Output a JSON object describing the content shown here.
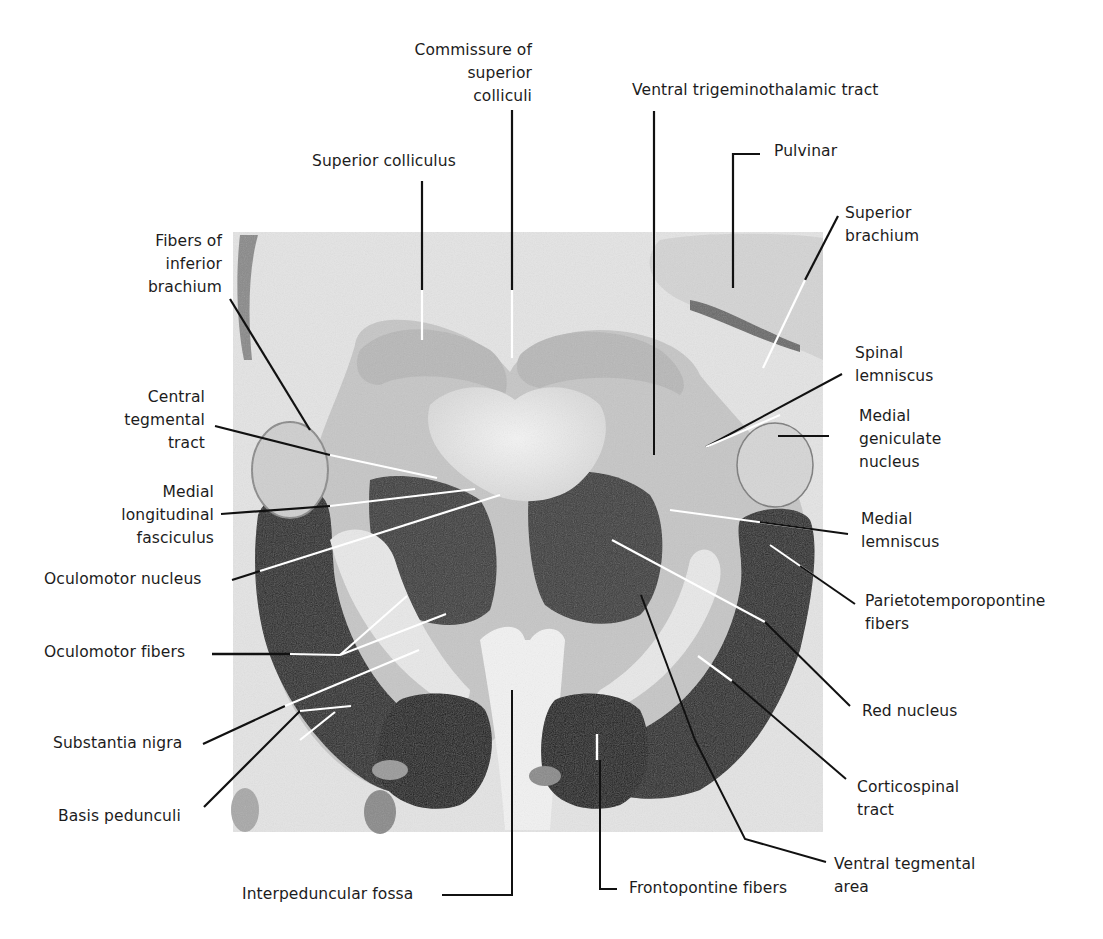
{
  "figure": {
    "colors": {
      "background": "#ffffff",
      "section_bg": "#e6e6e6",
      "dark_tissue": "#2a2a2a",
      "mid_tissue": "#9a9a9a",
      "light_tissue": "#d2d2d2",
      "text": "#1c1c1c",
      "leader_black": "#111111",
      "leader_white": "#ffffff"
    }
  },
  "labels": {
    "commissure": [
      "Commissure of",
      "superior",
      "colliculi"
    ],
    "superior_colliculus": [
      "Superior colliculus"
    ],
    "ventral_trigeminothalamic": [
      "Ventral trigeminothalamic tract"
    ],
    "pulvinar": [
      "Pulvinar"
    ],
    "superior_brachium": [
      "Superior",
      "brachium"
    ],
    "fibers_inferior_brachium": [
      "Fibers of",
      "inferior",
      "brachium"
    ],
    "spinal_lemniscus": [
      "Spinal",
      "lemniscus"
    ],
    "central_tegmental": [
      "Central",
      "tegmental",
      "tract"
    ],
    "medial_geniculate": [
      "Medial",
      "geniculate",
      "nucleus"
    ],
    "mlf": [
      "Medial",
      "longitudinal",
      "fasciculus"
    ],
    "medial_lemniscus": [
      "Medial",
      "lemniscus"
    ],
    "oculomotor_nucleus": [
      "Oculomotor nucleus"
    ],
    "parietotemporopontine": [
      "Parietotemporopontine",
      "fibers"
    ],
    "oculomotor_fibers": [
      "Oculomotor fibers"
    ],
    "red_nucleus": [
      "Red nucleus"
    ],
    "substantia_nigra": [
      "Substantia nigra"
    ],
    "corticospinal": [
      "Corticospinal",
      "tract"
    ],
    "basis_pedunculi": [
      "Basis pedunculi"
    ],
    "ventral_tegmental": [
      "Ventral tegmental",
      "area"
    ],
    "interpeduncular_fossa": [
      "Interpeduncular fossa"
    ],
    "frontopontine": [
      "Frontopontine fibers"
    ]
  }
}
